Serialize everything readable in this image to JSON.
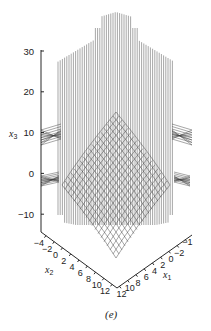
{
  "chart_data": {
    "type": "surface-3d",
    "caption": "(e)",
    "axes": {
      "x3": {
        "label": "x",
        "subscript": "3",
        "ticks": [
          "30",
          "20",
          "10",
          "0",
          "−10"
        ],
        "range": [
          -15,
          30
        ]
      },
      "x2": {
        "label": "x",
        "subscript": "2",
        "ticks": [
          "−4",
          "−2",
          "0",
          "2",
          "4",
          "6",
          "8",
          "10",
          "12"
        ],
        "range": [
          -4,
          12
        ]
      },
      "x1": {
        "label": "x",
        "subscript": "1",
        "ticks": [
          "12",
          "10",
          "8",
          "6",
          "4",
          "2",
          "0",
          "−2",
          "−1"
        ],
        "range": [
          -2,
          12
        ]
      }
    }
  }
}
